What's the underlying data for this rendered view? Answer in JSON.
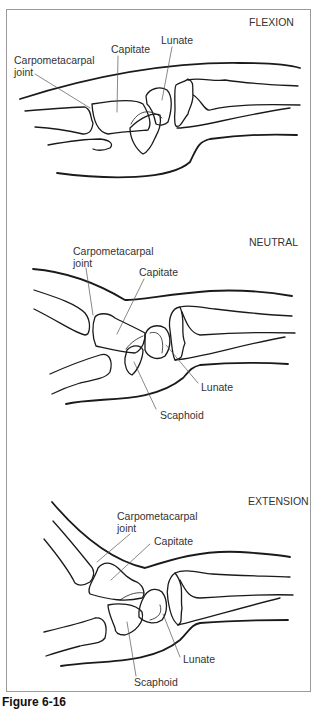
{
  "figure": {
    "panels": [
      {
        "title": "FLEXION",
        "labels": {
          "carpometacarpal_line1": "Carpometacarpal",
          "carpometacarpal_line2": "joint",
          "capitate": "Capitate",
          "lunate": "Lunate"
        }
      },
      {
        "title": "NEUTRAL",
        "labels": {
          "carpometacarpal_line1": "Carpometacarpal",
          "carpometacarpal_line2": "joint",
          "capitate": "Capitate",
          "lunate": "Lunate",
          "scaphoid": "Scaphoid"
        }
      },
      {
        "title": "EXTENSION",
        "labels": {
          "carpometacarpal_line1": "Carpometacarpal",
          "carpometacarpal_line2": "joint",
          "capitate": "Capitate",
          "lunate": "Lunate",
          "scaphoid": "Scaphoid"
        }
      }
    ],
    "caption": "Figure 6-16"
  },
  "colors": {
    "outline": "#1a1a1a",
    "leader": "#555555",
    "frame": "#9a9a9a"
  }
}
